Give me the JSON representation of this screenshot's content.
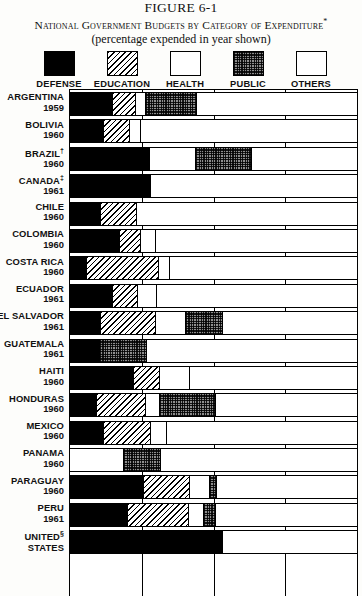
{
  "header": {
    "figure_number": "FIGURE 6-1",
    "title": "National Government Budgets by Category of Expenditure",
    "title_marker": "*",
    "subtitle": "(percentage expended in year shown)"
  },
  "legend": [
    {
      "label": "DEFENSE",
      "key": "defense",
      "pattern": "solid-black"
    },
    {
      "label": "EDUCATION",
      "key": "education",
      "pattern": "diagonal-hatch"
    },
    {
      "label": "HEALTH",
      "key": "health",
      "pattern": "white"
    },
    {
      "label": "PUBLIC\nWORKS",
      "key": "public_works",
      "pattern": "dark-dotted"
    },
    {
      "label": "OTHERS",
      "key": "others",
      "pattern": "checkerboard"
    }
  ],
  "chart_data": {
    "type": "bar",
    "orientation": "horizontal",
    "stacked": true,
    "title": "National Government Budgets by Category of Expenditure",
    "subtitle": "(percentage expended in year shown)",
    "xlabel": "",
    "ylabel": "",
    "xlim": [
      0,
      100
    ],
    "grid": true,
    "gridlines": [
      25,
      50,
      75
    ],
    "legend_position": "top",
    "categories": [
      "defense",
      "education",
      "health",
      "public_works",
      "others"
    ],
    "rows": [
      {
        "country": "ARGENTINA",
        "marker": "",
        "year": "1959",
        "values": {
          "defense": 14.5,
          "education": 8.0,
          "health": 3.5,
          "public_works": 18.0,
          "others": 56.0
        }
      },
      {
        "country": "BOLIVIA",
        "marker": "",
        "year": "1960",
        "values": {
          "defense": 11.5,
          "education": 9.0,
          "health": 4.0,
          "public_works": 0,
          "others": 75.5
        }
      },
      {
        "country": "BRAZIL",
        "marker": "†",
        "year": "1960",
        "values": {
          "defense": 27.5,
          "education": 0,
          "health": 16.0,
          "public_works": 19.5,
          "others": 37.0
        }
      },
      {
        "country": "CANADA",
        "marker": "‡",
        "year": "1961",
        "values": {
          "defense": 28.0,
          "education": 0,
          "health": 0,
          "public_works": 0,
          "others": 72.0
        }
      },
      {
        "country": "CHILE",
        "marker": "",
        "year": "1960",
        "values": {
          "defense": 10.5,
          "education": 12.5,
          "health": 0,
          "public_works": 0,
          "others": 77.0
        }
      },
      {
        "country": "COLOMBIA",
        "marker": "",
        "year": "1960",
        "values": {
          "defense": 17.0,
          "education": 7.5,
          "health": 5.0,
          "public_works": 0,
          "others": 70.5
        }
      },
      {
        "country": "COSTA RICA",
        "marker": "",
        "year": "1960",
        "values": {
          "defense": 5.5,
          "education": 25.0,
          "health": 4.0,
          "public_works": 0,
          "others": 65.5
        }
      },
      {
        "country": "ECUADOR",
        "marker": "",
        "year": "1961",
        "values": {
          "defense": 14.5,
          "education": 9.0,
          "health": 6.5,
          "public_works": 0,
          "others": 70.0
        }
      },
      {
        "country": "EL SALVADOR",
        "marker": "",
        "year": "1961",
        "values": {
          "defense": 10.5,
          "education": 19.0,
          "health": 10.5,
          "public_works": 13.0,
          "others": 47.0
        }
      },
      {
        "country": "GUATEMALA",
        "marker": "",
        "year": "1961",
        "values": {
          "defense": 10.0,
          "education": 0,
          "health": 0,
          "public_works": 16.5,
          "others": 73.5
        }
      },
      {
        "country": "HAITI",
        "marker": "",
        "year": "1960",
        "values": {
          "defense": 22.0,
          "education": 9.0,
          "health": 10.5,
          "public_works": 0,
          "others": 58.5
        }
      },
      {
        "country": "HONDURAS",
        "marker": "",
        "year": "1960",
        "values": {
          "defense": 9.0,
          "education": 17.0,
          "health": 5.0,
          "public_works": 19.5,
          "others": 49.5
        }
      },
      {
        "country": "MEXICO",
        "marker": "",
        "year": "1960",
        "values": {
          "defense": 11.5,
          "education": 16.5,
          "health": 5.5,
          "public_works": 0,
          "others": 66.5
        }
      },
      {
        "country": "PANAMA",
        "marker": "",
        "year": "1960",
        "values": {
          "defense": 0,
          "education": 0,
          "health": 18.5,
          "public_works": 13.0,
          "others": 68.5
        }
      },
      {
        "country": "PARAGUAY",
        "marker": "",
        "year": "1960",
        "values": {
          "defense": 25.5,
          "education": 16.0,
          "health": 7.0,
          "public_works": 2.5,
          "others": 49.0
        }
      },
      {
        "country": "PERU",
        "marker": "",
        "year": "1961",
        "values": {
          "defense": 20.0,
          "education": 21.0,
          "health": 5.5,
          "public_works": 4.0,
          "others": 49.5
        }
      },
      {
        "country": "UNITED STATES",
        "marker": "§",
        "year": "",
        "values": {
          "defense": 53.0,
          "education": 0,
          "health": 0,
          "public_works": 0,
          "others": 47.0
        }
      }
    ]
  }
}
